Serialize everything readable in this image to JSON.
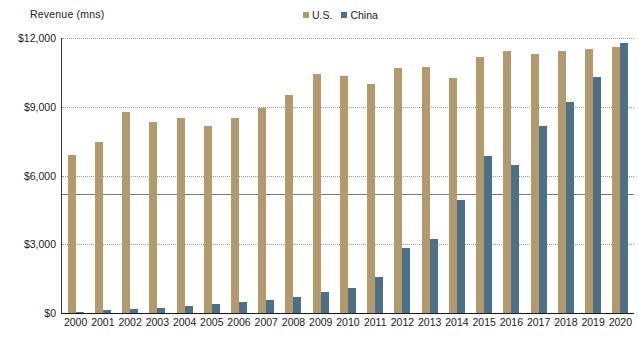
{
  "axis_title": "Revenue (mns)",
  "legend": {
    "position": "top-center",
    "entries": [
      {
        "label": "U.S.",
        "color": "#b29a6d",
        "icon": "square-swatch-icon"
      },
      {
        "label": "China",
        "color": "#4b7189",
        "icon": "square-swatch-icon"
      }
    ]
  },
  "colors": {
    "us": "#b29a6d",
    "china": "#4b7189",
    "gridline": "#9a9a9a",
    "axis": "#1b1b1b",
    "marker_line": "#6f7d86"
  },
  "y_axis": {
    "ticks": [
      "$12,000",
      "$9,000",
      "$6,000",
      "$3,000",
      "$0"
    ],
    "tick_values": [
      12000,
      9000,
      6000,
      3000,
      0
    ],
    "min": 0,
    "max": 12000
  },
  "marker_line_value": 5200,
  "chart_data": {
    "type": "bar",
    "title": "",
    "subtitle": "",
    "xlabel": "",
    "ylabel": "Revenue (mns)",
    "ylim": [
      0,
      12000
    ],
    "grid": true,
    "legend_position": "top-center",
    "categories": [
      "2000",
      "2001",
      "2002",
      "2003",
      "2004",
      "2005",
      "2006",
      "2007",
      "2008",
      "2009",
      "2010",
      "2011",
      "2012",
      "2013",
      "2014",
      "2015",
      "2016",
      "2017",
      "2018",
      "2019",
      "2020"
    ],
    "series": [
      {
        "name": "U.S.",
        "color": "#b29a6d",
        "values": [
          6900,
          7450,
          8750,
          8350,
          8500,
          8150,
          8500,
          8950,
          9500,
          10450,
          10350,
          10000,
          10700,
          10750,
          10250,
          11150,
          11450,
          11300,
          11450,
          11500,
          11600
        ]
      },
      {
        "name": "China",
        "color": "#4b7189",
        "values": [
          60,
          110,
          180,
          230,
          300,
          400,
          470,
          580,
          700,
          900,
          1100,
          1550,
          2850,
          3250,
          4950,
          6850,
          6450,
          8150,
          9200,
          10300,
          11800
        ]
      }
    ]
  }
}
